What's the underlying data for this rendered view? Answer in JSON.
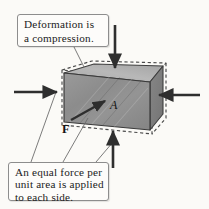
{
  "figure": {
    "background_color": "#fbfaf7"
  },
  "callouts": [
    {
      "id": "deformation-callout",
      "lines": [
        "Deformation is",
        "a compression."
      ],
      "box": {
        "x": 17,
        "y": 14,
        "w": 92,
        "h": 33
      },
      "border_color": "#8d8d8d",
      "fill_color": "#fdfcfa"
    },
    {
      "id": "force-callout",
      "lines": [
        "An equal force per",
        "unit area is applied",
        "to each side."
      ],
      "box": {
        "x": 8,
        "y": 162,
        "w": 101,
        "h": 39
      },
      "border_color": "#8d8d8d",
      "fill_color": "#fdfcfa"
    }
  ],
  "labels": [
    {
      "id": "area-label",
      "text": "A",
      "style": "italic",
      "x": 110,
      "y": 98
    },
    {
      "id": "force-label",
      "text": "F",
      "style": "bold",
      "x": 62,
      "y": 122
    }
  ],
  "block": {
    "front_face_color": "#8f8f8f",
    "top_face_color": "#b3b3b3",
    "right_face_color": "#7c7c7c",
    "edge_color": "#3a3a3a",
    "dashed_outline_color": "#4a4a4a",
    "dashed_outline_note": "original undeformed outline"
  },
  "arrows": [
    {
      "id": "arrow-top",
      "direction": "down",
      "from": [
        115,
        25
      ],
      "to": [
        115,
        72
      ],
      "color": "#2e2e2e"
    },
    {
      "id": "arrow-bottom",
      "direction": "up",
      "from": [
        113,
        168
      ],
      "to": [
        113,
        127
      ],
      "color": "#2e2e2e"
    },
    {
      "id": "arrow-left",
      "direction": "right",
      "from": [
        14,
        92
      ],
      "to": [
        60,
        92
      ],
      "color": "#2e2e2e"
    },
    {
      "id": "arrow-right",
      "direction": "left",
      "from": [
        200,
        95
      ],
      "to": [
        156,
        95
      ],
      "color": "#2e2e2e"
    },
    {
      "id": "arrow-force-F",
      "direction": "up-right",
      "from": [
        70,
        120
      ],
      "to": [
        107,
        100
      ],
      "color": "#2e2e2e"
    }
  ],
  "leader_lines": [
    {
      "id": "leader-deformation",
      "from": [
        74,
        47
      ],
      "to": [
        84,
        66
      ]
    },
    {
      "id": "leader-force-left",
      "from": [
        31,
        162
      ],
      "to": [
        56,
        92
      ]
    },
    {
      "id": "leader-force-center",
      "from": [
        62,
        162
      ],
      "to": [
        87,
        117
      ]
    },
    {
      "id": "leader-force-right",
      "from": [
        96,
        162
      ],
      "to": [
        112,
        143
      ]
    }
  ]
}
